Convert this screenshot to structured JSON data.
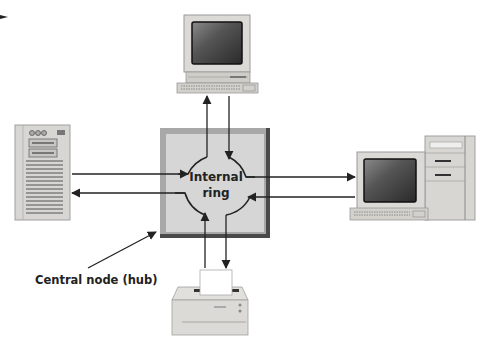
{
  "diagram": {
    "type": "star topology network with central hub containing internal ring",
    "hub": {
      "label_line1": "Internal",
      "label_line2": "ring",
      "callout": "Central node (hub)"
    },
    "nodes": [
      {
        "id": "top",
        "kind": "desktop computer",
        "position": "top"
      },
      {
        "id": "left",
        "kind": "server tower",
        "position": "left"
      },
      {
        "id": "right",
        "kind": "workstation with tower",
        "position": "right"
      },
      {
        "id": "bottom",
        "kind": "printer",
        "position": "bottom"
      }
    ],
    "links": [
      {
        "from": "hub",
        "to": "top",
        "direction": "bidirectional"
      },
      {
        "from": "hub",
        "to": "left",
        "direction": "bidirectional"
      },
      {
        "from": "hub",
        "to": "right",
        "direction": "bidirectional"
      },
      {
        "from": "hub",
        "to": "bottom",
        "direction": "bidirectional"
      }
    ]
  },
  "colors": {
    "hub_fill": "#d6d6d6",
    "hub_border_light": "#a8a8a8",
    "hub_border_dark": "#4a4a4a",
    "line": "#222222",
    "device_body": "#dcdad6",
    "screen": "#3a3a3a"
  }
}
